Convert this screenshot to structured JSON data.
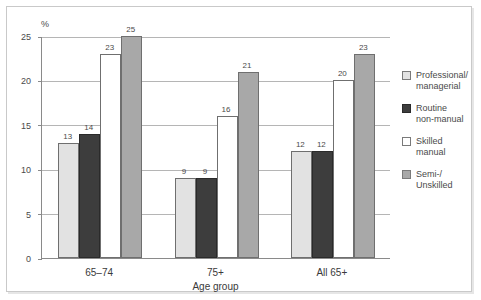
{
  "chart_data": {
    "type": "bar",
    "title": "",
    "xlabel": "Age group",
    "ylabel": "%",
    "ylim": [
      0,
      25
    ],
    "yticks": [
      0,
      5,
      10,
      15,
      20,
      25
    ],
    "ytick_labels": [
      "0",
      "5",
      "10",
      "15",
      "20",
      "25"
    ],
    "grid": true,
    "legend_position": "right",
    "categories": [
      "65–74",
      "75+",
      "All 65+"
    ],
    "series": [
      {
        "name": "Professional/\nmanagerial",
        "values": [
          13,
          9,
          12
        ],
        "color": "#e2e2e2"
      },
      {
        "name": "Routine\nnon-manual",
        "values": [
          14,
          9,
          12
        ],
        "color": "#3d3d3d"
      },
      {
        "name": "Skilled\nmanual",
        "values": [
          23,
          16,
          20
        ],
        "color": "#ffffff"
      },
      {
        "name": "Semi-/\nUnskilled",
        "values": [
          25,
          21,
          23
        ],
        "color": "#a8a8a8"
      }
    ],
    "bar_value_labels": [
      [
        "13",
        "14",
        "23",
        "25"
      ],
      [
        "9",
        "9",
        "16",
        "21"
      ],
      [
        "12",
        "12",
        "20",
        "23"
      ]
    ]
  }
}
